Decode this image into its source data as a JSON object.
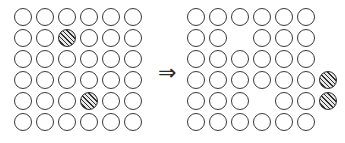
{
  "figure": {
    "width": 345,
    "height": 143,
    "background_color": "#ffffff",
    "outline_color": "#3a3a3a",
    "hatch_color": "#2f2f2f",
    "hatch_fill_color": "#e8e8e8"
  },
  "operator": {
    "name": "implies-double-arrow",
    "glyph": "⇒",
    "x": 158,
    "y": 62
  },
  "geometry": {
    "circle_diameter": 18,
    "col_spacing": 22,
    "row_spacing": 21,
    "left_origin_x": 14,
    "right_origin_x": 187,
    "origin_y": 8,
    "rows": 6,
    "cols": 6,
    "extra_col_index": 7
  },
  "panels": [
    {
      "id": "left-grid",
      "name": "before-grid",
      "label": "Before",
      "origin_x": 14,
      "origin_y": 8,
      "rows": [
        [
          "empty",
          "empty",
          "empty",
          "empty",
          "empty",
          "empty"
        ],
        [
          "empty",
          "empty",
          "hatched",
          "empty",
          "empty",
          "empty"
        ],
        [
          "empty",
          "empty",
          "empty",
          "empty",
          "empty",
          "empty"
        ],
        [
          "empty",
          "empty",
          "empty",
          "empty",
          "empty",
          "empty"
        ],
        [
          "empty",
          "empty",
          "empty",
          "hatched",
          "empty",
          "empty"
        ],
        [
          "empty",
          "empty",
          "empty",
          "empty",
          "empty",
          "empty"
        ]
      ],
      "hatched_positions": [
        {
          "row": 2,
          "col": 3
        },
        {
          "row": 5,
          "col": 4
        }
      ],
      "blank_positions": [],
      "circle_count": 36,
      "hatched_count": 2
    },
    {
      "id": "right-grid",
      "name": "after-grid",
      "label": "After",
      "origin_x": 187,
      "origin_y": 8,
      "rows": [
        [
          "empty",
          "empty",
          "empty",
          "empty",
          "empty",
          "empty",
          "none"
        ],
        [
          "empty",
          "empty",
          "none",
          "empty",
          "empty",
          "empty",
          "none"
        ],
        [
          "empty",
          "empty",
          "empty",
          "empty",
          "empty",
          "empty",
          "none"
        ],
        [
          "empty",
          "empty",
          "empty",
          "empty",
          "empty",
          "empty",
          "hatched"
        ],
        [
          "empty",
          "empty",
          "empty",
          "none",
          "empty",
          "empty",
          "hatched"
        ],
        [
          "empty",
          "empty",
          "empty",
          "empty",
          "empty",
          "empty",
          "none"
        ]
      ],
      "hatched_positions": [
        {
          "row": 4,
          "col": 7
        },
        {
          "row": 5,
          "col": 7
        }
      ],
      "blank_positions": [
        {
          "row": 2,
          "col": 3
        },
        {
          "row": 5,
          "col": 4
        }
      ],
      "circle_count": 36,
      "hatched_count": 2
    }
  ]
}
